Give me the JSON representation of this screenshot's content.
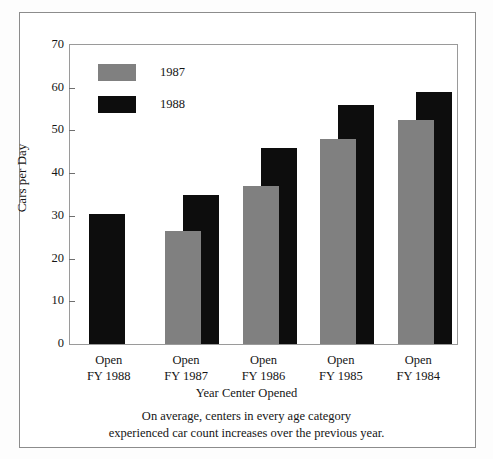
{
  "figure": {
    "background_color": "#ffffff",
    "frame_color": "#9a9a9a",
    "outer_border_color": "#8c8c8c"
  },
  "legend": {
    "position": "upper-left-inside",
    "entries": [
      {
        "label": "1987",
        "color": "#808080",
        "swatch_name": "legend-swatch-1987"
      },
      {
        "label": "1988",
        "color": "#0d0d0d",
        "swatch_name": "legend-swatch-1988"
      }
    ]
  },
  "caption": {
    "line1": "On average, centers in every age category",
    "line2": "experienced car count increases over the previous year."
  },
  "chart_data": {
    "type": "bar",
    "title": "",
    "subtitle": "",
    "xlabel": "Year Center Opened",
    "ylabel": "Cars per Day",
    "ylim": [
      0,
      70
    ],
    "yticks": [
      0,
      10,
      20,
      30,
      40,
      50,
      60,
      70
    ],
    "ytick_labels": [
      "0",
      "10",
      "20",
      "30",
      "40",
      "50",
      "60",
      "70"
    ],
    "grid": false,
    "legend_position": "upper left",
    "bar_style": "overlapped-grouped",
    "categories": [
      "Open FY 1988",
      "Open FY 1987",
      "Open FY 1986",
      "Open FY 1985",
      "Open FY 1984"
    ],
    "category_lines": [
      {
        "line1": "Open",
        "line2": "FY 1988"
      },
      {
        "line1": "Open",
        "line2": "FY 1987"
      },
      {
        "line1": "Open",
        "line2": "FY 1986"
      },
      {
        "line1": "Open",
        "line2": "FY 1985"
      },
      {
        "line1": "Open",
        "line2": "FY 1984"
      }
    ],
    "series": [
      {
        "name": "1987",
        "color": "#808080",
        "values": [
          null,
          26.5,
          37,
          48,
          52.5
        ]
      },
      {
        "name": "1988",
        "color": "#0d0d0d",
        "values": [
          30.5,
          35,
          46,
          56,
          59
        ]
      }
    ],
    "annotations": [
      "No 1987 bar for centers opened FY 1988 (no prior-year data)."
    ]
  }
}
